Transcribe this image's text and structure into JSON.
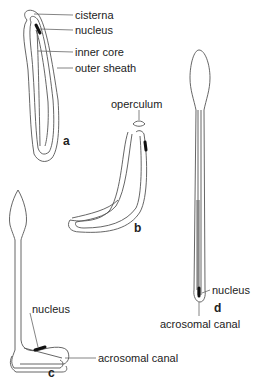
{
  "figure": {
    "panels": [
      {
        "id": "a",
        "label": "a",
        "labels": [
          "cisterna",
          "nucleus",
          "inner core",
          "outer sheath"
        ]
      },
      {
        "id": "b",
        "label": "b",
        "labels": [
          "operculum"
        ]
      },
      {
        "id": "c",
        "label": "c",
        "labels": [
          "nucleus",
          "acrosomal canal"
        ]
      },
      {
        "id": "d",
        "label": "d",
        "labels": [
          "nucleus",
          "acrosomal canal"
        ]
      }
    ]
  }
}
